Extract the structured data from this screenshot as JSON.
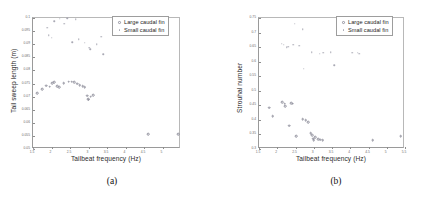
{
  "figure": {
    "panels": [
      {
        "caption": "(a)",
        "legend": [
          {
            "label": "Large caudal fin",
            "marker": "open-circle-marker"
          },
          {
            "label": "Small caudal fin",
            "marker": "dot-marker"
          }
        ],
        "chart_data": {
          "type": "scatter",
          "title": "",
          "xlabel": "Tailbeat frequency (Hz)",
          "ylabel": "Tail sweep length (m)",
          "xlim": [
            1.5,
            5.5
          ],
          "ylim": [
            0.05,
            0.1
          ],
          "xticks": [
            1.5,
            2,
            2.5,
            3,
            3.5,
            4,
            4.5,
            5
          ],
          "xticklabels": [
            "1.5",
            "2",
            "2.5",
            "3",
            "3.5",
            "4",
            "4.5",
            "5"
          ],
          "yticks": [
            0.05,
            0.055,
            0.06,
            0.065,
            0.07,
            0.075,
            0.08,
            0.085,
            0.09,
            0.095,
            0.1
          ],
          "yticklabels": [
            "0.05",
            "0.055",
            "0.06",
            "0.065",
            "0.07",
            "0.075",
            "0.08",
            "0.085",
            "0.09",
            "0.095",
            "0.1"
          ],
          "grid": false,
          "legend_position": "upper-right",
          "series": [
            {
              "name": "Large caudal fin",
              "marker": "open-circle-marker",
              "points": [
                [
                  1.62,
                  0.0712
                ],
                [
                  1.75,
                  0.0728
                ],
                [
                  1.86,
                  0.0742
                ],
                [
                  1.95,
                  0.0737
                ],
                [
                  2.02,
                  0.0752
                ],
                [
                  2.07,
                  0.0756
                ],
                [
                  2.16,
                  0.074
                ],
                [
                  2.21,
                  0.0735
                ],
                [
                  2.33,
                  0.0752
                ],
                [
                  2.46,
                  0.0757
                ],
                [
                  2.55,
                  0.0757
                ],
                [
                  2.62,
                  0.0755
                ],
                [
                  2.7,
                  0.075
                ],
                [
                  2.76,
                  0.0744
                ],
                [
                  2.84,
                  0.074
                ],
                [
                  2.9,
                  0.0736
                ],
                [
                  2.96,
                  0.0704
                ],
                [
                  2.99,
                  0.069
                ],
                [
                  3.0,
                  0.0688
                ],
                [
                  3.06,
                  0.07
                ],
                [
                  3.12,
                  0.0706
                ],
                [
                  4.62,
                  0.0556
                ],
                [
                  5.42,
                  0.0556
                ]
              ]
            },
            {
              "name": "Small caudal fin",
              "marker": "dot-marker",
              "points": [
                [
                  1.88,
                  0.0962
                ],
                [
                  1.92,
                  0.0935
                ],
                [
                  2.0,
                  0.0925
                ],
                [
                  2.07,
                  0.0988
                ],
                [
                  2.22,
                  0.0998
                ],
                [
                  2.35,
                  0.0978
                ],
                [
                  2.42,
                  0.1
                ],
                [
                  2.56,
                  0.0908
                ],
                [
                  2.66,
                  0.0995
                ],
                [
                  2.74,
                  0.0918
                ],
                [
                  2.9,
                  0.0905
                ],
                [
                  3.02,
                  0.0886
                ],
                [
                  3.05,
                  0.088
                ],
                [
                  3.22,
                  0.09
                ],
                [
                  3.35,
                  0.0928
                ],
                [
                  3.4,
                  0.0862
                ],
                [
                  1.52,
                  0.05
                ]
              ]
            }
          ]
        }
      },
      {
        "caption": "(b)",
        "legend": [
          {
            "label": "Large caudal fin",
            "marker": "open-circle-marker"
          },
          {
            "label": "Small caudal fin",
            "marker": "dot-marker"
          }
        ],
        "chart_data": {
          "type": "scatter",
          "title": "",
          "xlabel": "Tailbeat frequency (Hz)",
          "ylabel": "Strouhal number",
          "xlim": [
            1.5,
            5.5
          ],
          "ylim": [
            0.3,
            0.75
          ],
          "xticks": [
            1.5,
            2,
            2.5,
            3,
            3.5,
            4,
            4.5,
            5,
            5.5
          ],
          "xticklabels": [
            "1.5",
            "2",
            "2.5",
            "3",
            "3.5",
            "4",
            "4.5",
            "5",
            "5.5"
          ],
          "yticks": [
            0.3,
            0.35,
            0.4,
            0.45,
            0.5,
            0.55,
            0.6,
            0.65,
            0.7,
            0.75
          ],
          "yticklabels": [
            "0.3",
            "0.35",
            "0.4",
            "0.45",
            "0.5",
            "0.55",
            "0.6",
            "0.65",
            "0.7",
            "0.75"
          ],
          "grid": false,
          "legend_position": "upper-right",
          "series": [
            {
              "name": "Large caudal fin",
              "marker": "open-circle-marker",
              "points": [
                [
                  1.78,
                  0.442
                ],
                [
                  1.88,
                  0.412
                ],
                [
                  2.13,
                  0.46
                ],
                [
                  2.2,
                  0.455
                ],
                [
                  2.22,
                  0.448
                ],
                [
                  2.38,
                  0.458
                ],
                [
                  2.42,
                  0.455
                ],
                [
                  2.32,
                  0.38
                ],
                [
                  2.52,
                  0.343
                ],
                [
                  2.7,
                  0.402
                ],
                [
                  2.78,
                  0.398
                ],
                [
                  2.84,
                  0.392
                ],
                [
                  2.92,
                  0.355
                ],
                [
                  2.96,
                  0.347
                ],
                [
                  2.98,
                  0.336
                ],
                [
                  3.0,
                  0.33
                ],
                [
                  3.04,
                  0.34
                ],
                [
                  3.12,
                  0.334
                ],
                [
                  3.18,
                  0.332
                ],
                [
                  3.24,
                  0.33
                ],
                [
                  4.62,
                  0.33
                ],
                [
                  5.38,
                  0.344
                ]
              ]
            },
            {
              "name": "Small caudal fin",
              "marker": "dot-marker",
              "points": [
                [
                  2.12,
                  0.662
                ],
                [
                  2.18,
                  0.658
                ],
                [
                  2.26,
                  0.65
                ],
                [
                  2.3,
                  0.652
                ],
                [
                  2.44,
                  0.658
                ],
                [
                  2.48,
                  0.73
                ],
                [
                  2.6,
                  0.655
                ],
                [
                  2.7,
                  0.712
                ],
                [
                  2.72,
                  0.575
                ],
                [
                  2.94,
                  0.632
                ],
                [
                  3.16,
                  0.628
                ],
                [
                  3.26,
                  0.63
                ],
                [
                  3.46,
                  0.632
                ],
                [
                  3.56,
                  0.588
                ],
                [
                  4.06,
                  0.63
                ],
                [
                  4.2,
                  0.63
                ],
                [
                  4.24,
                  0.628
                ]
              ]
            }
          ]
        }
      }
    ]
  }
}
